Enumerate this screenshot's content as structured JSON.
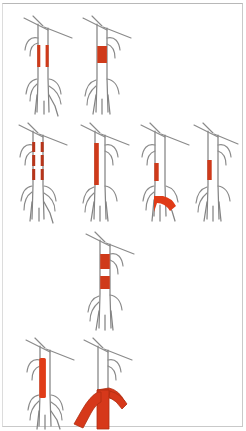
{
  "figure": {
    "title": "Aortic vessel schematic panel",
    "background_color": "#ffffff",
    "border_color": "#c9c9c9",
    "vessel_color": "#848484",
    "lesion_color": "#cf3a1a",
    "rows": [
      {
        "row_index": 1,
        "panels": [
          {
            "id": "panel-a",
            "label": "",
            "lesion_pattern": "bilateral-short-parallel-bands",
            "lesion_count": 2,
            "lesion_side": "both-walls",
            "lesion_extent": "short",
            "bifurcation_involved": false
          },
          {
            "id": "panel-b",
            "label": "",
            "lesion_pattern": "single-short-block",
            "lesion_count": 1,
            "lesion_side": "full-lumen",
            "lesion_extent": "short",
            "bifurcation_involved": false
          }
        ]
      },
      {
        "row_index": 2,
        "panels": [
          {
            "id": "panel-c",
            "label": "",
            "lesion_pattern": "segmented-interrupted-band",
            "lesion_count": 4,
            "lesion_side": "both-walls",
            "lesion_extent": "long",
            "bifurcation_involved": false
          },
          {
            "id": "panel-d",
            "label": "",
            "lesion_pattern": "long-continuous-band",
            "lesion_count": 1,
            "lesion_side": "left-wall",
            "lesion_extent": "long",
            "bifurcation_involved": false
          },
          {
            "id": "panel-e",
            "label": "",
            "lesion_pattern": "short-band-plus-bifurcation-blob",
            "lesion_count": 2,
            "lesion_side": "left-wall",
            "lesion_extent": "short",
            "bifurcation_involved": true
          },
          {
            "id": "panel-f",
            "label": "",
            "lesion_pattern": "single-short-band",
            "lesion_count": 1,
            "lesion_side": "left-wall",
            "lesion_extent": "short",
            "bifurcation_involved": false
          }
        ]
      },
      {
        "row_index": 3,
        "panels": [
          {
            "id": "panel-g",
            "label": "",
            "lesion_pattern": "two-separated-blocks",
            "lesion_count": 2,
            "lesion_side": "full-lumen",
            "lesion_extent": "medium",
            "bifurcation_involved": false
          }
        ]
      },
      {
        "row_index": 4,
        "panels": [
          {
            "id": "panel-h",
            "label": "",
            "lesion_pattern": "long-solid-wide-band",
            "lesion_count": 1,
            "lesion_side": "left-wall",
            "lesion_extent": "very-long",
            "bifurcation_involved": false
          },
          {
            "id": "panel-i",
            "label": "",
            "lesion_pattern": "bifurcation-full-involvement",
            "lesion_count": 1,
            "lesion_side": "full-lumen",
            "lesion_extent": "distal",
            "bifurcation_involved": true
          }
        ]
      }
    ]
  }
}
